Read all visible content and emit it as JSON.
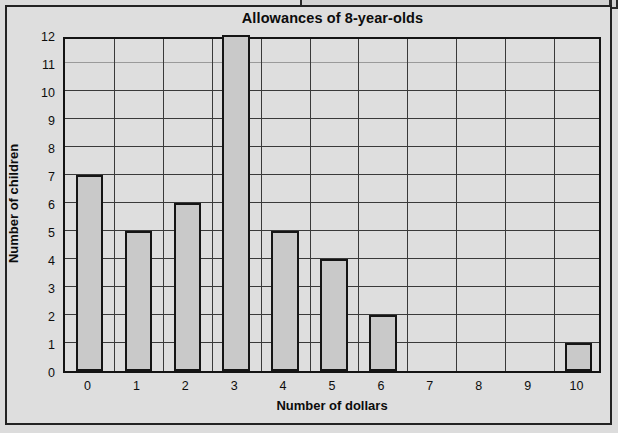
{
  "chart_data": {
    "type": "bar",
    "title": "Allowances of 8-year-olds",
    "xlabel": "Number of dollars",
    "ylabel": "Number of children",
    "categories": [
      "0",
      "1",
      "2",
      "3",
      "4",
      "5",
      "6",
      "7",
      "8",
      "9",
      "10"
    ],
    "values": [
      7,
      5,
      6,
      12,
      5,
      4,
      2,
      0,
      0,
      0,
      1
    ],
    "ylim": [
      0,
      12
    ],
    "yticks": [
      "0",
      "1",
      "2",
      "3",
      "4",
      "5",
      "6",
      "7",
      "8",
      "9",
      "10",
      "11",
      "12"
    ],
    "grid": true,
    "legend": null,
    "bar_color": "#c9c9c9",
    "bar_edge_color": "#151515",
    "plot_background": "#dedede"
  }
}
